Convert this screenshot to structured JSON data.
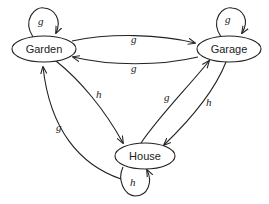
{
  "diagram": {
    "type": "state-transition",
    "nodes": [
      {
        "id": "garden",
        "label": "Garden"
      },
      {
        "id": "garage",
        "label": "Garage"
      },
      {
        "id": "house",
        "label": "House"
      }
    ],
    "edges": [
      {
        "from": "garden",
        "to": "garden",
        "label": "g"
      },
      {
        "from": "garage",
        "to": "garage",
        "label": "g"
      },
      {
        "from": "house",
        "to": "house",
        "label": "h"
      },
      {
        "from": "garden",
        "to": "garage",
        "label": "g"
      },
      {
        "from": "garage",
        "to": "garden",
        "label": "g"
      },
      {
        "from": "garden",
        "to": "house",
        "label": "h"
      },
      {
        "from": "house",
        "to": "garage",
        "label": "g"
      },
      {
        "from": "garage",
        "to": "house",
        "label": "h"
      },
      {
        "from": "house",
        "to": "garden",
        "label": "g"
      }
    ]
  }
}
